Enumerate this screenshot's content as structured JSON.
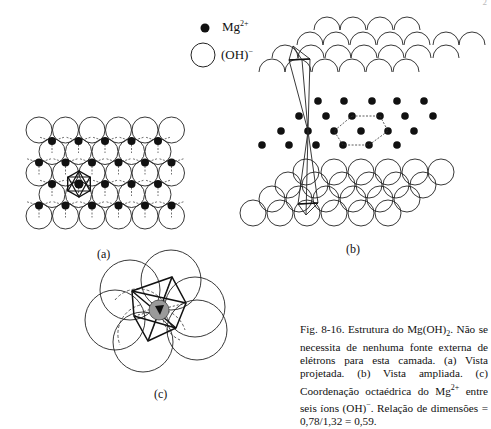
{
  "page": {
    "page_number": "2"
  },
  "legend": {
    "items": [
      {
        "symbol": "filled-dot",
        "label": "Mg",
        "superscript": "2+"
      },
      {
        "symbol": "open-circle",
        "label": "(OH)",
        "superscript": "−"
      }
    ]
  },
  "figure": {
    "panels": [
      {
        "id": "a",
        "label": "(a)",
        "description": "Vista projetada"
      },
      {
        "id": "b",
        "label": "(b)",
        "description": "Vista ampliada"
      },
      {
        "id": "c",
        "label": "(c)",
        "description": "Coordenação octaédrica do Mg2+ entre seis íons (OH)−"
      }
    ],
    "caption": {
      "figure_id": "Fig. 8-16.",
      "text_1": "Estrutura do Mg(OH)",
      "sub_1": "2",
      "text_2": ". Não se necessita de nenhuma fonte externa de elétrons para esta camada. (a) Vista projetada. (b) Vista ampliada. (c) Coordenação octaédrica do Mg",
      "sup_1": "2+",
      "text_3": " entre seis íons (OH)",
      "sup_2": "−",
      "text_4": ". Relação de dimensões = 0,78/1,32 = 0,59."
    }
  }
}
